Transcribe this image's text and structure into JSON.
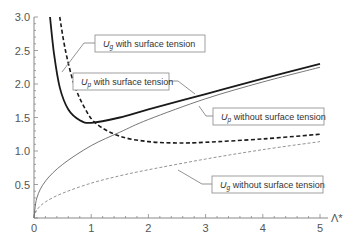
{
  "chart_data": {
    "type": "line",
    "title": "",
    "xlabel": "Λ*",
    "ylabel": "",
    "xlim": [
      0,
      5
    ],
    "ylim": [
      0,
      3.0
    ],
    "grid": false,
    "x_ticks": [
      "0",
      "1",
      "2",
      "3",
      "4",
      "5"
    ],
    "y_ticks": [
      "0.5",
      "1.0",
      "1.5",
      "2.0",
      "2.5",
      "3.0"
    ],
    "legend_position": "inline annotations with leader lines",
    "series": [
      {
        "name": "U_p with surface tension",
        "style": "thick solid",
        "x": [
          0.28,
          0.35,
          0.45,
          0.6,
          0.8,
          1.0,
          1.5,
          2.0,
          3.0,
          4.0,
          5.0
        ],
        "values": [
          3.0,
          2.45,
          1.95,
          1.62,
          1.46,
          1.42,
          1.5,
          1.62,
          1.85,
          2.08,
          2.3
        ]
      },
      {
        "name": "U_g with surface tension",
        "style": "thick dashed",
        "x": [
          0.45,
          0.55,
          0.7,
          0.9,
          1.1,
          1.5,
          2.0,
          2.5,
          3.0,
          4.0,
          5.0
        ],
        "values": [
          3.0,
          2.5,
          2.0,
          1.62,
          1.4,
          1.22,
          1.14,
          1.12,
          1.13,
          1.18,
          1.25
        ]
      },
      {
        "name": "U_p without surface tension",
        "style": "thin solid",
        "x": [
          0,
          0.05,
          0.2,
          0.5,
          1.0,
          1.5,
          2.0,
          3.0,
          4.0,
          5.0
        ],
        "values": [
          0,
          0.3,
          0.55,
          0.8,
          1.08,
          1.28,
          1.47,
          1.78,
          2.03,
          2.25
        ]
      },
      {
        "name": "U_g without surface tension",
        "style": "thin dashed",
        "x": [
          0,
          0.05,
          0.2,
          0.5,
          1.0,
          1.5,
          2.0,
          3.0,
          4.0,
          5.0
        ],
        "values": [
          0,
          0.12,
          0.24,
          0.37,
          0.52,
          0.63,
          0.72,
          0.88,
          1.02,
          1.14
        ]
      }
    ],
    "annotations": [
      {
        "var": "U",
        "sub": "g",
        "text": " with surface tension"
      },
      {
        "var": "U",
        "sub": "p",
        "text": " with surface tension"
      },
      {
        "var": "U",
        "sub": "p",
        "text": " without surface tension"
      },
      {
        "var": "U",
        "sub": "g",
        "text": " without surface tension"
      }
    ]
  }
}
